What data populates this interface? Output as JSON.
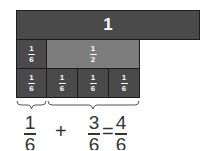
{
  "whole_bar": {
    "label": "1"
  },
  "row2": [
    {
      "num": "1",
      "den": "6"
    },
    {
      "num": "1",
      "den": "2"
    }
  ],
  "row3": [
    {
      "num": "1",
      "den": "6"
    },
    {
      "num": "1",
      "den": "6"
    },
    {
      "num": "1",
      "den": "6"
    },
    {
      "num": "1",
      "den": "6"
    }
  ],
  "equation": {
    "term1": {
      "num": "1",
      "den": "6"
    },
    "plus": "+",
    "term2": {
      "num": "3",
      "den": "6"
    },
    "equals": "=",
    "result": {
      "num": "4",
      "den": "6"
    }
  },
  "colors": {
    "dark": "#4a4a4a",
    "mid": "#7d7d7d",
    "border": "#1c1c1c"
  }
}
